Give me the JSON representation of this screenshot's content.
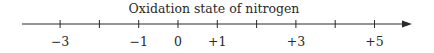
{
  "chart_data": {
    "type": "number-line",
    "title": "Oxidation state of nitrogen",
    "range": [
      -4,
      6
    ],
    "ticks": [
      -3,
      -2,
      -1,
      0,
      1,
      2,
      3,
      4,
      5
    ],
    "tick_labels": [
      {
        "value": -3,
        "text": "−3"
      },
      {
        "value": -1,
        "text": "−1"
      },
      {
        "value": 0,
        "text": "0"
      },
      {
        "value": 1,
        "text": "+1"
      },
      {
        "value": 3,
        "text": "+3"
      },
      {
        "value": 5,
        "text": "+5"
      }
    ],
    "arrow": "right"
  },
  "colors": {
    "line": "#2a2a2a"
  }
}
